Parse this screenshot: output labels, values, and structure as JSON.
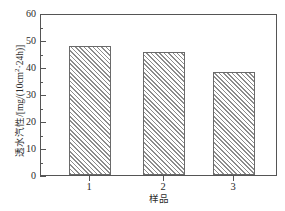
{
  "chart_data": {
    "type": "bar",
    "title": "",
    "categories": [
      "1",
      "2",
      "3"
    ],
    "values": [
      48,
      46,
      38.5
    ],
    "series": [
      {
        "name": "透水汽性",
        "values": [
          48,
          46,
          38.5
        ]
      }
    ],
    "xlabel": "样品",
    "ylabel": "透水汽性/[mg/(10cm²·24h)]",
    "ylim": [
      0,
      60
    ],
    "ytick_labels": [
      "0",
      "10",
      "20",
      "30",
      "40",
      "50",
      "60"
    ],
    "ytick_values": [
      0,
      10,
      20,
      30,
      40,
      50,
      60
    ],
    "yminor_values": [
      5,
      15,
      25,
      35,
      45,
      55
    ],
    "grid": false,
    "legend": false,
    "bar_fill": "diagonal-hatch",
    "bar_edge_color": "#6a6a6a",
    "frame_color": "#555555"
  },
  "axis": {
    "y_title_main": "透水汽性/[mg/(10cm",
    "y_title_sup": "2",
    "y_title_tail": "·24h)]",
    "x_title": "样品"
  },
  "ticks": {
    "y": [
      {
        "label": "60",
        "value": 60
      },
      {
        "label": "50",
        "value": 50
      },
      {
        "label": "40",
        "value": 40
      },
      {
        "label": "30",
        "value": 30
      },
      {
        "label": "20",
        "value": 20
      },
      {
        "label": "10",
        "value": 10
      },
      {
        "label": "0",
        "value": 0
      }
    ],
    "x": [
      {
        "label": "1"
      },
      {
        "label": "2"
      },
      {
        "label": "3"
      }
    ]
  }
}
